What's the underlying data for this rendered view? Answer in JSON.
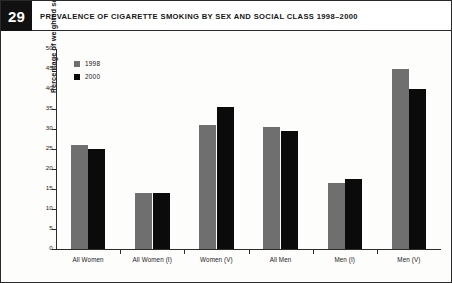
{
  "header": {
    "figure_number": "29",
    "title": "PREVALENCE OF CIGARETTE SMOKING BY SEX AND SOCIAL CLASS 1998–2000"
  },
  "chart_data": {
    "type": "bar",
    "title": "PREVALENCE OF CIGARETTE SMOKING BY SEX AND SOCIAL CLASS 1998–2000",
    "xlabel": "",
    "ylabel": "Percentage of weighted sample",
    "ylim": [
      0,
      50
    ],
    "ytick_step": 5,
    "yticks": [
      "0",
      "5",
      "10",
      "15",
      "20",
      "25",
      "30",
      "35",
      "40",
      "45",
      "50"
    ],
    "grid": false,
    "legend_position": "top-left-inside",
    "categories": [
      "All Women",
      "All Women (I)",
      "Women (V)",
      "All Men",
      "Men (I)",
      "Men (V)"
    ],
    "series": [
      {
        "name": "1998",
        "color": "#6f6f6f",
        "values": [
          26,
          14,
          31,
          30.5,
          16.5,
          45
        ]
      },
      {
        "name": "2000",
        "color": "#0b0b0b",
        "values": [
          25,
          14,
          35.5,
          29.5,
          17.5,
          40
        ]
      }
    ]
  }
}
